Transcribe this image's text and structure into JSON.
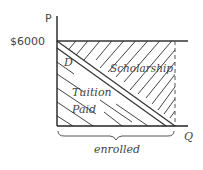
{
  "diagram": {
    "y_axis_label": "P",
    "x_axis_label": "Q",
    "price_label": "$6000",
    "demand_label": "D",
    "region_upper_label": "Scholarship",
    "region_lower_label_line1": "Tuition",
    "region_lower_label_line2": "Paid",
    "brace_label": "enrolled",
    "colors": {
      "ink": "#333333",
      "background": "#ffffff"
    }
  }
}
